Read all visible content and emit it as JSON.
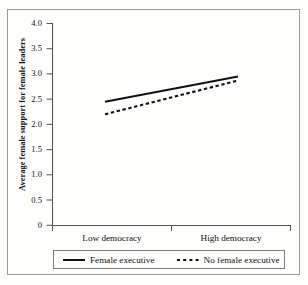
{
  "figure": {
    "name": "line-chart-female-support"
  },
  "chart_data": {
    "type": "line",
    "title": "",
    "xlabel": "",
    "ylabel": "Average female support for female leaders",
    "categories": [
      "Low democracy",
      "High democracy"
    ],
    "x": [
      0,
      1
    ],
    "xlim": [
      -0.45,
      1.48
    ],
    "ylim": [
      0,
      4.0
    ],
    "yticks": [
      "0",
      "0.5",
      "1.0",
      "1.5",
      "2.0",
      "2.5",
      "3.0",
      "3.5",
      "4.0"
    ],
    "ytick_values": [
      0,
      0.5,
      1.0,
      1.5,
      2.0,
      2.5,
      3.0,
      3.5,
      4.0
    ],
    "grid": false,
    "legend_position": "below-axes",
    "series": [
      {
        "name": "Female executive",
        "style": "solid",
        "color": "#111111",
        "values": [
          2.45,
          2.95
        ]
      },
      {
        "name": "No female executive",
        "style": "dashed",
        "color": "#111111",
        "values": [
          2.2,
          2.87
        ]
      }
    ]
  },
  "axis": {
    "y_title": "Average female support for female leaders",
    "tick_0": "0",
    "tick_1": "0.5",
    "tick_2": "1.0",
    "tick_3": "1.5",
    "tick_4": "2.0",
    "tick_5": "2.5",
    "tick_6": "3.0",
    "tick_7": "3.5",
    "tick_8": "4.0",
    "x_label_left": "Low democracy",
    "x_label_right": "High democracy"
  },
  "legend": {
    "entry_1": "Female executive",
    "entry_2": "No female executive"
  },
  "colors": {
    "line": "#111111",
    "axis": "#555553",
    "border": "#9a9a96",
    "background": "#fefefd"
  }
}
